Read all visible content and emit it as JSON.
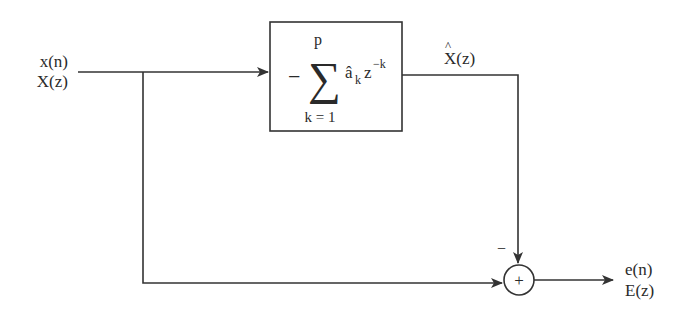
{
  "diagram": {
    "type": "linear-prediction-error-filter block diagram",
    "input": {
      "time_label": "x(n)",
      "z_label": "X(z)"
    },
    "predictor_block": {
      "sign": "−",
      "sum_symbol": "∑",
      "upper_limit": "p",
      "lower_limit": "k = 1",
      "coefficient": "â",
      "coefficient_subscript": "k",
      "z_term": "z",
      "z_exponent": "−k"
    },
    "prediction_output": {
      "label_base": "X",
      "label_hat": "^",
      "label_arg": "(z)"
    },
    "summer": {
      "symbol": "+",
      "minus_sign": "−"
    },
    "output": {
      "time_label": "e(n)",
      "z_label": "E(z)"
    },
    "colors": {
      "line": "#333333",
      "background": "#ffffff"
    }
  }
}
